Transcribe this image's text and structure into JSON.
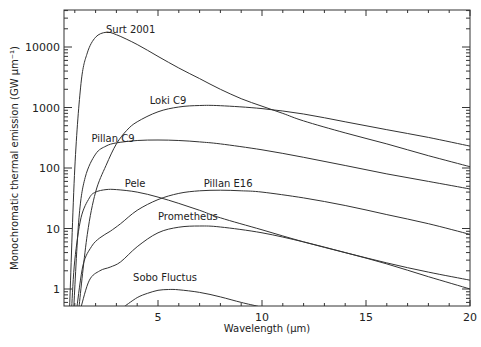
{
  "chart_data": {
    "type": "line",
    "title": "",
    "xlabel": "Wavelength (µm)",
    "ylabel": "Monochromatic thermal emission (GW µm⁻¹)",
    "xlim": [
      0.5,
      20
    ],
    "ylim": [
      0.52,
      40000
    ],
    "yscale": "log",
    "grid": false,
    "legend": "inline labels",
    "x_ticks": [
      5,
      10,
      15,
      20
    ],
    "y_ticks": [
      1,
      10,
      100,
      1000,
      10000
    ],
    "x_tick_labels": [
      "5",
      "10",
      "15",
      "20"
    ],
    "y_tick_labels": [
      "1",
      "10",
      "100",
      "1000",
      "10000"
    ],
    "series": [
      {
        "name": "Surt 2001",
        "label_pos": [
          2.5,
          17000
        ],
        "x": [
          0.75,
          1.0,
          1.3,
          1.6,
          2.0,
          2.5,
          3.0,
          4.0,
          5.0,
          6.0,
          7.0,
          8.0,
          9.0,
          10.0,
          11.0,
          12.0,
          14.0,
          16.0,
          18.0,
          20.0
        ],
        "y": [
          0.5,
          100,
          2500,
          8000,
          14500,
          17500,
          16000,
          11000,
          7000,
          4500,
          3000,
          2000,
          1400,
          1050,
          800,
          600,
          380,
          250,
          160,
          105
        ]
      },
      {
        "name": "Loki C9",
        "label_pos": [
          4.6,
          1150
        ],
        "x": [
          1.2,
          1.6,
          2.0,
          2.5,
          3.0,
          3.5,
          4.0,
          5.0,
          6.0,
          7.0,
          8.0,
          10.0,
          12.0,
          14.0,
          16.0,
          18.0,
          20.0
        ],
        "y": [
          0.5,
          8,
          40,
          110,
          250,
          420,
          580,
          850,
          1020,
          1080,
          1070,
          960,
          780,
          580,
          430,
          320,
          230
        ]
      },
      {
        "name": "Pillan C9",
        "label_pos": [
          1.8,
          270
        ],
        "x": [
          0.95,
          1.2,
          1.5,
          2.0,
          2.5,
          3.0,
          4.0,
          5.0,
          6.0,
          7.0,
          8.0,
          10.0,
          12.0,
          14.0,
          16.0,
          18.0,
          20.0
        ],
        "y": [
          0.5,
          15,
          70,
          170,
          230,
          260,
          285,
          290,
          285,
          270,
          250,
          200,
          150,
          110,
          80,
          60,
          45
        ]
      },
      {
        "name": "Pele",
        "label_pos": [
          3.4,
          48
        ],
        "x": [
          0.85,
          1.0,
          1.3,
          1.7,
          2.0,
          2.5,
          3.0,
          4.0,
          5.0,
          6.0,
          7.0,
          8.0,
          10.0,
          12.0,
          14.0,
          16.0,
          18.0,
          20.0
        ],
        "y": [
          0.5,
          3,
          15,
          32,
          40,
          44,
          44,
          40,
          33,
          26,
          20,
          15,
          9.5,
          6,
          4,
          2.7,
          1.9,
          1.4
        ]
      },
      {
        "name": "Pillan E16",
        "label_pos": [
          7.2,
          48
        ],
        "x": [
          1.1,
          1.4,
          1.8,
          2.2,
          2.7,
          3.2,
          4.0,
          5.0,
          6.0,
          7.0,
          8.0,
          9.0,
          10.0,
          12.0,
          14.0,
          16.0,
          18.0,
          20.0
        ],
        "y": [
          0.5,
          2.5,
          5,
          7,
          9,
          12,
          20,
          30,
          38,
          42,
          43,
          42,
          40,
          32,
          24,
          17,
          12,
          8
        ]
      },
      {
        "name": "Prometheus",
        "label_pos": [
          5.0,
          14
        ],
        "x": [
          1.3,
          1.7,
          2.2,
          2.7,
          3.2,
          4.0,
          5.0,
          6.0,
          7.0,
          8.0,
          10.0,
          12.0,
          14.0,
          16.0,
          18.0,
          20.0
        ],
        "y": [
          0.5,
          1.4,
          2.0,
          2.3,
          2.8,
          5.0,
          8.5,
          10.5,
          11.0,
          10.6,
          8.5,
          6.0,
          4.0,
          2.6,
          1.6,
          1.0
        ]
      },
      {
        "name": "Sobo Fluctus",
        "label_pos": [
          3.8,
          1.35
        ],
        "x": [
          3.4,
          4.0,
          4.5,
          5.0,
          5.5,
          6.0,
          7.0,
          8.0,
          9.0,
          9.8
        ],
        "y": [
          0.52,
          0.72,
          0.85,
          0.95,
          0.98,
          0.97,
          0.88,
          0.74,
          0.6,
          0.52
        ]
      }
    ]
  },
  "axes": {
    "xlabel": "Wavelength (µm)",
    "ylabel": "Monochromatic thermal emission (GW µm⁻¹)"
  }
}
